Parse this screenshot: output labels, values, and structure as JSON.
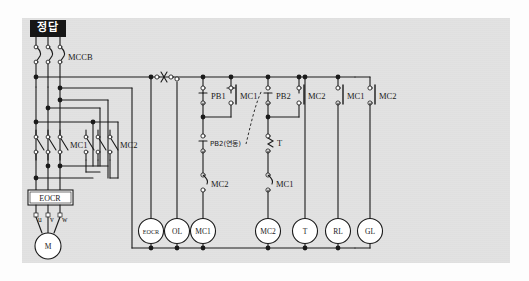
{
  "page": {
    "badge_label": "정답",
    "background_color": "#e2e2e2",
    "line_color": "#1a1a1a",
    "node_fill": "#1a1a1a",
    "terminal_fill": "#ffffff"
  },
  "diagram": {
    "type": "ladder-control-circuit",
    "power_section": {
      "breaker_label": "MCCB",
      "breaker_poles": 3,
      "contactor_labels": [
        "MC1",
        "MC2"
      ],
      "relay_box_label": "EOCR",
      "motor_label": "M",
      "motor_terminals": [
        "u",
        "v",
        "w"
      ]
    },
    "control_section": {
      "contacts": [
        {
          "name": "PB1",
          "label": "PB1",
          "type": "pushbutton-nc"
        },
        {
          "name": "MC1-aux",
          "label": "MC1",
          "type": "contact-no"
        },
        {
          "name": "PB2",
          "label": "PB2",
          "type": "pushbutton-nc"
        },
        {
          "name": "MC2-aux",
          "label": "MC2",
          "type": "contact-no"
        },
        {
          "name": "MC1-rl",
          "label": "MC1",
          "type": "contact-no"
        },
        {
          "name": "MC2-gl",
          "label": "MC2",
          "type": "contact-no"
        },
        {
          "name": "PB2-interlock",
          "label": "PB2(연동)",
          "type": "pushbutton-linked"
        },
        {
          "name": "T-contact",
          "label": "T",
          "type": "timer-contact"
        },
        {
          "name": "MC2-interlock",
          "label": "MC2",
          "type": "contact-nc"
        },
        {
          "name": "MC1-interlock",
          "label": "MC1",
          "type": "contact-nc"
        },
        {
          "name": "MC2-branch",
          "label": "MC2",
          "type": "contact-nc"
        },
        {
          "name": "MC1-branch",
          "label": "MC1",
          "type": "contact-nc"
        }
      ],
      "coils": [
        {
          "label": "EOCR",
          "name": "coil-eocr"
        },
        {
          "label": "OL",
          "name": "coil-ol"
        },
        {
          "label": "MC1",
          "name": "coil-mc1"
        },
        {
          "label": "MC2",
          "name": "coil-mc2"
        },
        {
          "label": "T",
          "name": "coil-t"
        },
        {
          "label": "RL",
          "name": "coil-rl"
        },
        {
          "label": "GL",
          "name": "coil-gl"
        }
      ]
    }
  }
}
